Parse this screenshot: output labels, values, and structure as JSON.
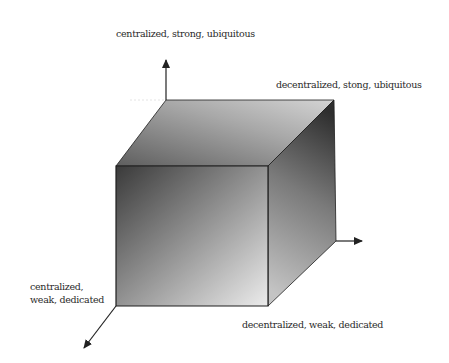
{
  "diagram": {
    "type": "3d-cube-axes",
    "labels": {
      "top": "centralized, strong, ubiquitous",
      "top_right": "decentralized, stong, ubiquitous",
      "bottom_left": "centralized,\nweak, dedicated",
      "bottom_right": "decentralized, weak, dedicated"
    },
    "axes": [
      {
        "name": "vertical-axis",
        "direction": "up"
      },
      {
        "name": "horizontal-axis",
        "direction": "right"
      },
      {
        "name": "depth-axis",
        "direction": "down-left"
      }
    ],
    "colors": {
      "edge": "#1e1e1e",
      "front_dark": "#3a3a3a",
      "front_light": "#ececec",
      "top_dark": "#5e5e5e",
      "top_light": "#d4d4d4",
      "side_dark": "#2e2e2e",
      "side_light": "#c4c4c4",
      "arrow": "#222222"
    }
  }
}
